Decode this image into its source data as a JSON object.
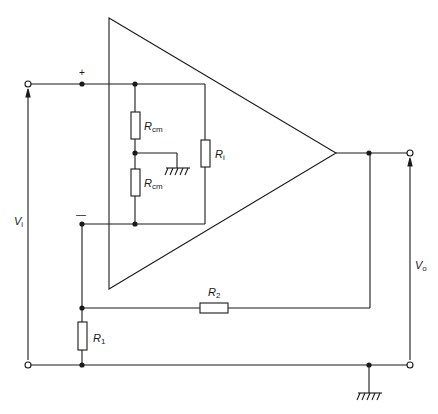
{
  "labels": {
    "plus": "+",
    "minus": "—",
    "rcm_upper": {
      "main": "R",
      "sub": "cm"
    },
    "rcm_lower": {
      "main": "R",
      "sub": "cm"
    },
    "ri": {
      "main": "R",
      "sub": "i"
    },
    "r1": {
      "main": "R",
      "sub": "1"
    },
    "r2": {
      "main": "R",
      "sub": "2"
    },
    "vi": {
      "main": "V",
      "sub": "i"
    },
    "vo": {
      "main": "V",
      "sub": "o"
    }
  },
  "colors": {
    "stroke": "#1a1a1a",
    "background": "#ffffff"
  }
}
